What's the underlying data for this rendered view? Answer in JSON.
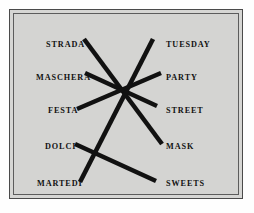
{
  "figure": {
    "background_color": "#d4d4d2",
    "page_color": "#ffffff",
    "border_color": "#4a4a4a",
    "line_color": "#111111",
    "text_color": "#111111"
  },
  "left_column": {
    "language": "Italian",
    "items": [
      {
        "label": "STRADA",
        "x": 32,
        "y": 27
      },
      {
        "label": "MASCHERA",
        "x": 22,
        "y": 60
      },
      {
        "label": "FESTA",
        "x": 34,
        "y": 93
      },
      {
        "label": "DOLCI",
        "x": 31,
        "y": 129
      },
      {
        "label": "MARTEDI",
        "x": 23,
        "y": 166
      }
    ]
  },
  "right_column": {
    "language": "English",
    "items": [
      {
        "label": "TUESDAY",
        "x": 152,
        "y": 27
      },
      {
        "label": "PARTY",
        "x": 152,
        "y": 60
      },
      {
        "label": "STREET",
        "x": 152,
        "y": 93
      },
      {
        "label": "MASK",
        "x": 152,
        "y": 129
      },
      {
        "label": "SWEETS",
        "x": 152,
        "y": 166
      }
    ]
  },
  "connections": [
    {
      "from": "STRADA",
      "to": "MASK",
      "x1": 70,
      "y1": 25,
      "x2": 148,
      "y2": 130
    },
    {
      "from": "MASCHERA",
      "to": "STREET",
      "x1": 71,
      "y1": 59,
      "x2": 143,
      "y2": 92
    },
    {
      "from": "FESTA",
      "to": "PARTY",
      "x1": 63,
      "y1": 95,
      "x2": 147,
      "y2": 59
    },
    {
      "from": "DOLCI",
      "to": "SWEETS",
      "x1": 61,
      "y1": 130,
      "x2": 142,
      "y2": 167
    },
    {
      "from": "MARTEDI",
      "to": "TUESDAY",
      "x1": 66,
      "y1": 168,
      "x2": 139,
      "y2": 25
    }
  ],
  "line_style": {
    "stroke_width": 4.6,
    "linecap": "butt"
  }
}
